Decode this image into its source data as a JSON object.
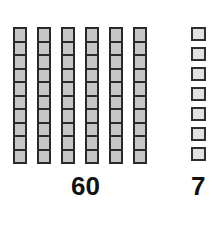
{
  "diagram": {
    "type": "base-ten-blocks",
    "tens": {
      "rod_count": 6,
      "cells_per_rod": 10,
      "label": "60",
      "fill_color": "#c6c6c6",
      "border_color": "#2a2a2a"
    },
    "ones": {
      "unit_count": 7,
      "label": "7",
      "fill_color": "#e2e2e2",
      "border_color": "#2f2f2f"
    }
  }
}
